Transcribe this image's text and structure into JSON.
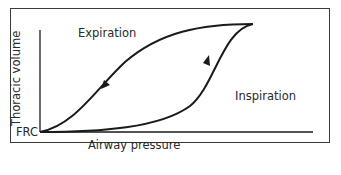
{
  "diagram": {
    "type": "pressure-volume hysteresis loop",
    "labels": {
      "y_axis": "Thoracic volume",
      "x_axis": "Airway pressure",
      "origin": "FRC",
      "upper_curve": "Expiration",
      "lower_curve": "Inspiration"
    },
    "curves": [
      {
        "name": "Expiration",
        "direction": "from top-right back to FRC",
        "arrow": "down-left"
      },
      {
        "name": "Inspiration",
        "direction": "from FRC up to top-right",
        "arrow": "up-right"
      }
    ],
    "colors": {
      "line": "#1a1a1a",
      "frame": "#3a3a3a",
      "text": "#2a2a2a",
      "background": "#ffffff"
    }
  }
}
